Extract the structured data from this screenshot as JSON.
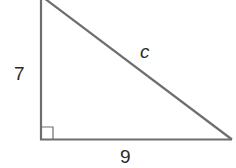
{
  "diagram": {
    "type": "right-triangle",
    "labels": {
      "vertical_leg": "7",
      "horizontal_leg": "9",
      "hypotenuse": "c"
    },
    "right_angle_marker": true,
    "colors": {
      "line": "#6e6e6e",
      "text": "#2a2a2a",
      "background": "#ffffff"
    }
  }
}
